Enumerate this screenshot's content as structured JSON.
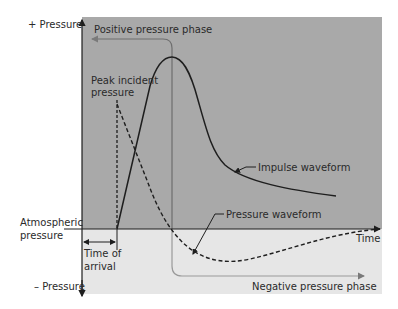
{
  "diagram": {
    "axis": {
      "y_positive_label": "+ Pressure",
      "y_negative_label": "– Pressure",
      "baseline_label_line1": "Atmospheric",
      "baseline_label_line2": "pressure",
      "x_label": "Time"
    },
    "phases": {
      "positive": "Positive pressure phase",
      "negative": "Negative pressure phase"
    },
    "annotations": {
      "peak_line1": "Peak incident",
      "peak_line2": "pressure",
      "time_of_arrival_line1": "Time of",
      "time_of_arrival_line2": "arrival",
      "impulse_waveform": "Impulse waveform",
      "pressure_waveform": "Pressure waveform"
    },
    "colors": {
      "positive_region": "#a9a9a9",
      "negative_region": "#e6e6e6",
      "line": "#1e1e1e",
      "phase_arrow": "#7a7a7a"
    }
  }
}
